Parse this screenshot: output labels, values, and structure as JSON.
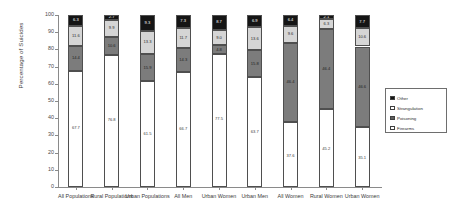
{
  "chart_data": {
    "type": "bar",
    "stacked": true,
    "title": "",
    "xlabel": "",
    "ylabel": "Percentage of Suicides",
    "ylim": [
      0,
      100
    ],
    "yticks": [
      0,
      10,
      20,
      30,
      40,
      50,
      60,
      70,
      80,
      90,
      100
    ],
    "grid": false,
    "legend_position": "right",
    "categories": [
      "All Populations",
      "Rural Populations",
      "Urban Populations",
      "All Men",
      "Urban Women",
      "Urban Men",
      "All Women",
      "Rural Women",
      "Urban Women"
    ],
    "series": [
      {
        "name": "Firearms",
        "color": "#ffffff",
        "values": [
          67.7,
          76.8,
          61.5,
          66.7,
          77.5,
          63.7,
          37.6,
          45.2,
          35.1
        ]
      },
      {
        "name": "Poisoning",
        "color": "#7c7c7c",
        "values": [
          14.4,
          10.6,
          15.9,
          14.3,
          4.8,
          15.8,
          46.4,
          46.4,
          46.6
        ]
      },
      {
        "name": "Strangulation",
        "color": "#d5d5d5",
        "values": [
          11.6,
          9.9,
          13.3,
          11.7,
          9.0,
          13.6,
          9.6,
          6.3,
          10.6
        ]
      },
      {
        "name": "Other",
        "color": "#151515",
        "values": [
          6.3,
          2.7,
          9.3,
          7.3,
          8.7,
          6.9,
          6.4,
          2.1,
          7.7
        ]
      }
    ]
  },
  "legend": {
    "items": [
      {
        "label": "Other",
        "swatch": "other"
      },
      {
        "label": "Strangulation",
        "swatch": "strangulation"
      },
      {
        "label": "Poisoning",
        "swatch": "poisoning"
      },
      {
        "label": "Firearms",
        "swatch": "firearms"
      }
    ]
  },
  "axes": {
    "y_title": "Percentage of Suicides"
  }
}
